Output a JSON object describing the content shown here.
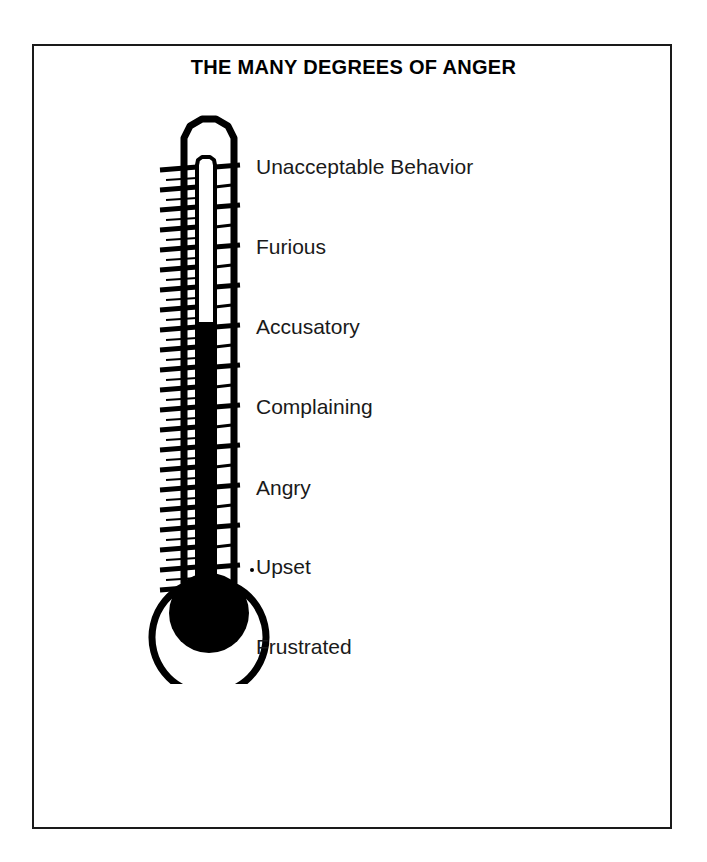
{
  "poster": {
    "title": "THE MANY DEGREES OF ANGER",
    "background_color": "#ffffff",
    "frame_color": "#1a1a1a",
    "ink_color": "#000000"
  },
  "thermometer": {
    "icon": "thermometer-icon",
    "fill_color": "#000000",
    "outline_color": "#000000",
    "glass_color": "#ffffff",
    "mercury_level_percent": 55,
    "tick_count_left": 24,
    "tick_count_right": 24
  },
  "scale": {
    "labels": [
      {
        "text": "Unacceptable Behavior",
        "top": 48
      },
      {
        "text": "Furious",
        "top": 128
      },
      {
        "text": "Accusatory",
        "top": 208
      },
      {
        "text": "Complaining",
        "top": 288
      },
      {
        "text": "Angry",
        "top": 369
      },
      {
        "text": "Upset",
        "top": 448
      },
      {
        "text": "Frustrated",
        "top": 528
      }
    ]
  }
}
